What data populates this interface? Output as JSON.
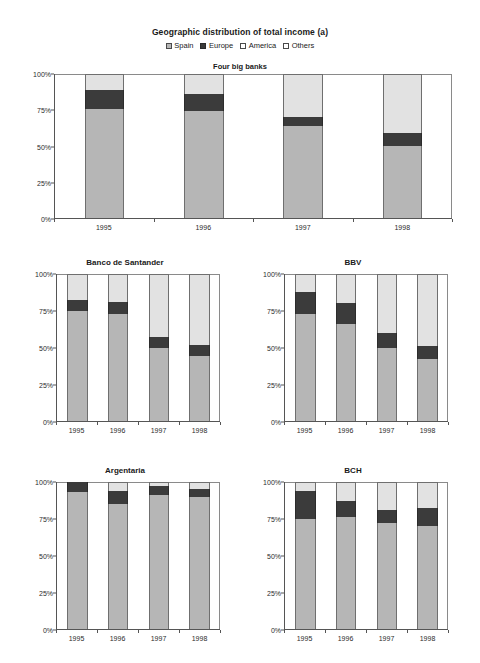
{
  "figure": {
    "title": "Geographic distribution of total income (a)",
    "legend": [
      {
        "label": "Spain",
        "key": "spain",
        "color": "#b6b6b6"
      },
      {
        "label": "Europe",
        "key": "europe",
        "color": "#3b3b3b"
      },
      {
        "label": "America",
        "key": "america",
        "color": "#ffffff"
      },
      {
        "label": "Others",
        "key": "others",
        "color": "#ffffff"
      }
    ]
  },
  "chart_data": [
    {
      "id": "four-big-banks",
      "type": "bar",
      "stacked": true,
      "title": "Four big banks",
      "title_placement": "inside-top",
      "categories": [
        "1995",
        "1996",
        "1997",
        "1998"
      ],
      "xlabel": "",
      "ylabel": "",
      "ylim": [
        0,
        100
      ],
      "yticks": [
        0,
        25,
        50,
        75,
        100
      ],
      "ytick_labels": [
        "0%",
        "25%",
        "50%",
        "75%",
        "100%"
      ],
      "grid": false,
      "legend_position": "figure-top",
      "series": [
        {
          "name": "Spain",
          "values": [
            76,
            74,
            64,
            50
          ]
        },
        {
          "name": "Europe",
          "values": [
            13,
            12,
            6,
            9
          ]
        },
        {
          "name": "Others",
          "values": [
            11,
            14,
            30,
            41
          ]
        }
      ]
    },
    {
      "id": "banco-de-santander",
      "type": "bar",
      "stacked": true,
      "title": "Banco de Santander",
      "title_placement": "above",
      "categories": [
        "1995",
        "1996",
        "1997",
        "1998"
      ],
      "xlabel": "",
      "ylabel": "",
      "ylim": [
        0,
        100
      ],
      "yticks": [
        0,
        25,
        50,
        75,
        100
      ],
      "ytick_labels": [
        "0%",
        "25%",
        "50%",
        "75%",
        "100%"
      ],
      "grid": false,
      "series": [
        {
          "name": "Spain",
          "values": [
            75,
            73,
            50,
            44
          ]
        },
        {
          "name": "Europe",
          "values": [
            7,
            8,
            7,
            8
          ]
        },
        {
          "name": "Others",
          "values": [
            18,
            19,
            43,
            48
          ]
        }
      ]
    },
    {
      "id": "bbv",
      "type": "bar",
      "stacked": true,
      "title": "BBV",
      "title_placement": "above",
      "categories": [
        "1995",
        "1996",
        "1997",
        "1998"
      ],
      "xlabel": "",
      "ylabel": "",
      "ylim": [
        0,
        100
      ],
      "yticks": [
        0,
        25,
        50,
        75,
        100
      ],
      "ytick_labels": [
        "0%",
        "25%",
        "50%",
        "75%",
        "100%"
      ],
      "grid": false,
      "series": [
        {
          "name": "Spain",
          "values": [
            73,
            66,
            50,
            42
          ]
        },
        {
          "name": "Europe",
          "values": [
            15,
            14,
            10,
            9
          ]
        },
        {
          "name": "Others",
          "values": [
            12,
            20,
            40,
            49
          ]
        }
      ]
    },
    {
      "id": "argentaria",
      "type": "bar",
      "stacked": true,
      "title": "Argentaria",
      "title_placement": "above",
      "categories": [
        "1995",
        "1996",
        "1997",
        "1998"
      ],
      "xlabel": "",
      "ylabel": "",
      "ylim": [
        0,
        100
      ],
      "yticks": [
        0,
        25,
        50,
        75,
        100
      ],
      "ytick_labels": [
        "0%",
        "25%",
        "50%",
        "75%",
        "100%"
      ],
      "grid": false,
      "series": [
        {
          "name": "Spain",
          "values": [
            93,
            85,
            91,
            90
          ]
        },
        {
          "name": "Europe",
          "values": [
            7,
            9,
            6,
            5
          ]
        },
        {
          "name": "Others",
          "values": [
            0,
            6,
            3,
            5
          ]
        }
      ]
    },
    {
      "id": "bch",
      "type": "bar",
      "stacked": true,
      "title": "BCH",
      "title_placement": "above",
      "categories": [
        "1995",
        "1996",
        "1997",
        "1998"
      ],
      "xlabel": "",
      "ylabel": "",
      "ylim": [
        0,
        100
      ],
      "yticks": [
        0,
        25,
        50,
        75,
        100
      ],
      "ytick_labels": [
        "0%",
        "25%",
        "50%",
        "75%",
        "100%"
      ],
      "grid": false,
      "series": [
        {
          "name": "Spain",
          "values": [
            75,
            76,
            72,
            70
          ]
        },
        {
          "name": "Europe",
          "values": [
            19,
            11,
            9,
            12
          ]
        },
        {
          "name": "Others",
          "values": [
            6,
            13,
            19,
            18
          ]
        }
      ]
    }
  ]
}
